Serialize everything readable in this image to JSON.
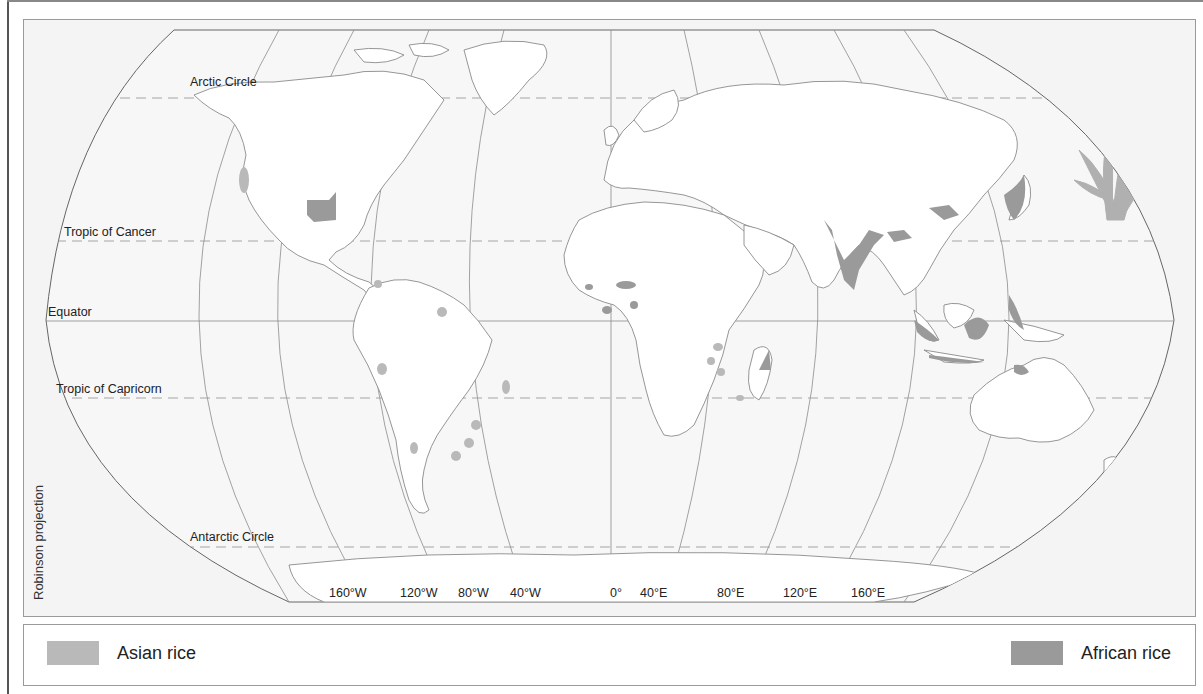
{
  "map": {
    "projection_label": "Robinson projection",
    "latitude_lines": [
      {
        "name": "Arctic Circle",
        "label": "Arctic Circle"
      },
      {
        "name": "Tropic of Cancer",
        "label": "Tropic of Cancer"
      },
      {
        "name": "Equator",
        "label": "Equator"
      },
      {
        "name": "Tropic of Capricorn",
        "label": "Tropic of Capricorn"
      },
      {
        "name": "Antarctic Circle",
        "label": "Antarctic Circle"
      }
    ],
    "longitude_labels": [
      "160°W",
      "120°W",
      "80°W",
      "40°W",
      "0°",
      "40°E",
      "80°E",
      "120°E",
      "160°E"
    ],
    "colors": {
      "ocean": "#f4f4f4",
      "land": "#ffffff",
      "coast": "#8a8a8a",
      "grid": "#8c8c8c",
      "asian_rice": "#b9b9b9",
      "african_rice": "#9a9a9a",
      "rice_plant": "#b0b0b0"
    },
    "decoration": "rice-plant-illustration"
  },
  "legend": {
    "items": [
      {
        "label": "Asian rice",
        "color": "#b9b9b9"
      },
      {
        "label": "African rice",
        "color": "#9a9a9a"
      }
    ]
  }
}
